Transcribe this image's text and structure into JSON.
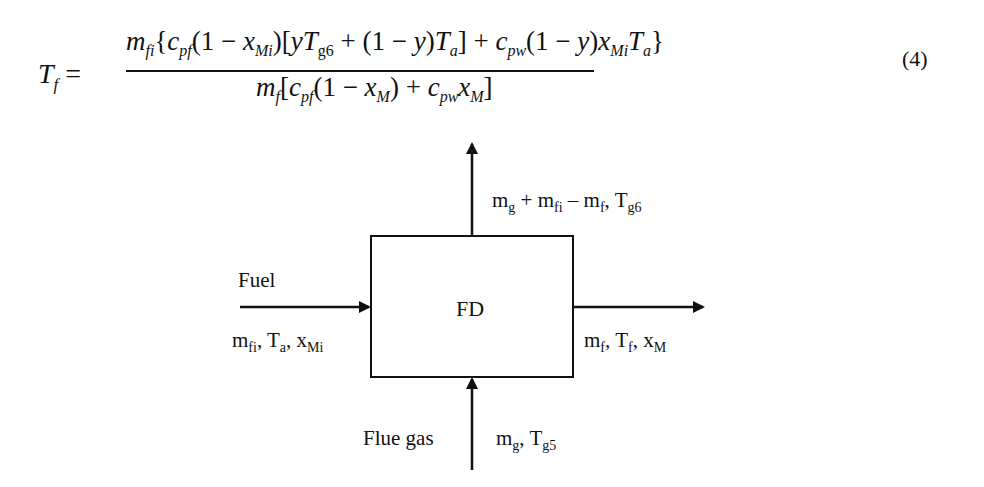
{
  "equation": {
    "lhs": "T",
    "lhs_sub": "f",
    "numerator": "m_fi{c_pf(1 − x_Mi)[yT_g6 + (1 − y)T_a] + c_pw(1 − y)x_Mi T_a}",
    "denominator": "m_f[c_pf(1 − x_M) + c_pw x_M]",
    "number": "(4)"
  },
  "diagram": {
    "box_label": "FD",
    "top_output": {
      "text": "m_g + m_fi − m_f, T_g6"
    },
    "left_input": {
      "title": "Fuel",
      "text": "m_fi, T_a, x_Mi"
    },
    "right_output": {
      "text": "m_f, T_f, x_M"
    },
    "bottom_input": {
      "title": "Flue gas",
      "text": "m_g, T_g5"
    }
  }
}
